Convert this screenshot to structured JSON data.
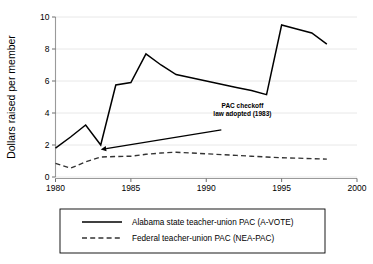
{
  "chart_data": {
    "type": "line",
    "title": "",
    "xlabel": "",
    "ylabel": "Dollars raised per member",
    "xlim": [
      1980,
      2000
    ],
    "ylim": [
      0,
      10
    ],
    "xticks": [
      1980,
      1985,
      1990,
      1995,
      2000
    ],
    "xtick_labels": [
      "1980",
      "1985",
      "1990",
      "1995",
      "2000"
    ],
    "yticks": [
      0,
      2,
      4,
      6,
      8,
      10
    ],
    "ytick_labels": [
      "0",
      "2",
      "4",
      "6",
      "8",
      "10"
    ],
    "grid": "horizontal",
    "legend_position": "below-plot",
    "series": [
      {
        "name": "Alabama state teacher-union PAC (A-VOTE)",
        "style": "solid",
        "color": "#000000",
        "x": [
          1980,
          1981,
          1982,
          1983,
          1984,
          1985,
          1986,
          1987,
          1988,
          1989,
          1990,
          1991,
          1992,
          1993,
          1994,
          1995,
          1996,
          1997,
          1998
        ],
        "values": [
          1.8,
          2.5,
          3.25,
          2.0,
          5.75,
          5.9,
          7.7,
          7.0,
          6.4,
          6.2,
          6.0,
          5.8,
          5.6,
          5.4,
          5.15,
          9.5,
          9.25,
          9.0,
          8.3
        ]
      },
      {
        "name": "Federal teacher-union PAC (NEA-PAC)",
        "style": "dashed",
        "color": "#333333",
        "x": [
          1980,
          1981,
          1982,
          1983,
          1984,
          1985,
          1986,
          1987,
          1988,
          1989,
          1990,
          1991,
          1992,
          1993,
          1994,
          1995,
          1996,
          1997,
          1998
        ],
        "values": [
          0.85,
          0.55,
          0.95,
          1.25,
          1.28,
          1.3,
          1.42,
          1.5,
          1.55,
          1.5,
          1.45,
          1.4,
          1.35,
          1.3,
          1.25,
          1.2,
          1.18,
          1.15,
          1.12
        ]
      }
    ],
    "annotations": [
      {
        "name": "pac-checkoff-note",
        "lines": [
          "PAC checkoff",
          "law adopted (1983)"
        ],
        "text_x": 1992.4,
        "text_y": 4.3,
        "arrow_from_x": 1991.0,
        "arrow_from_y": 2.95,
        "arrow_to_x": 1983.0,
        "arrow_to_y": 1.72
      }
    ],
    "legend_entries": [
      "Alabama state teacher-union PAC (A-VOTE)",
      "Federal teacher-union PAC (NEA-PAC)"
    ]
  }
}
